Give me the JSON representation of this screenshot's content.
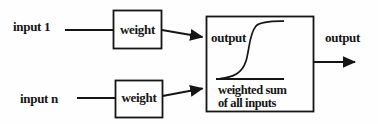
{
  "colors": {
    "ink": "#151515",
    "paper": "#fefefe"
  },
  "diagram": {
    "inputs": [
      {
        "label": "input 1"
      },
      {
        "label": "input n"
      }
    ],
    "weights": [
      {
        "label": "weight"
      },
      {
        "label": "weight"
      }
    ],
    "activation": {
      "yaxis_label": "output",
      "xaxis_label_line1": "weighted sum",
      "xaxis_label_line2": "of all inputs",
      "curve": "sigmoid"
    },
    "output_label": "output"
  }
}
